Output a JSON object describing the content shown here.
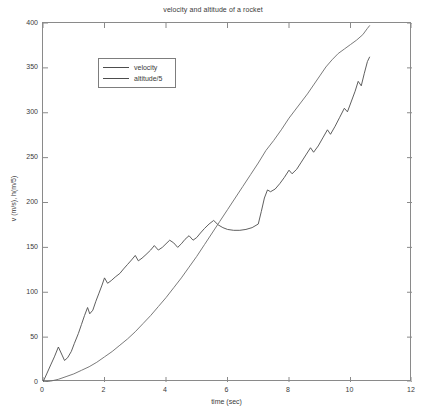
{
  "chart_data": {
    "type": "line",
    "title": "velocity and altitude of a rocket",
    "xlabel": "time (sec)",
    "ylabel": "v (m/s), h(m/5)",
    "xlim": [
      0,
      12
    ],
    "ylim": [
      0,
      400
    ],
    "xticks": [
      0,
      2,
      4,
      6,
      8,
      10,
      12
    ],
    "yticks": [
      0,
      50,
      100,
      150,
      200,
      250,
      300,
      350,
      400
    ],
    "grid": false,
    "legend_position": "upper left",
    "legend": [
      "velocity",
      "altitude/5"
    ],
    "series": [
      {
        "name": "velocity",
        "color": "#4d4d4d",
        "points": [
          [
            0.0,
            0
          ],
          [
            0.12,
            9
          ],
          [
            0.25,
            19
          ],
          [
            0.37,
            28
          ],
          [
            0.5,
            39
          ],
          [
            0.62,
            30
          ],
          [
            0.7,
            24
          ],
          [
            0.8,
            27
          ],
          [
            0.92,
            34
          ],
          [
            1.02,
            43
          ],
          [
            1.15,
            54
          ],
          [
            1.25,
            64
          ],
          [
            1.35,
            74
          ],
          [
            1.45,
            83
          ],
          [
            1.52,
            76
          ],
          [
            1.62,
            80
          ],
          [
            1.72,
            90
          ],
          [
            1.82,
            99
          ],
          [
            1.92,
            108
          ],
          [
            2.0,
            116
          ],
          [
            2.1,
            110
          ],
          [
            2.22,
            113
          ],
          [
            2.35,
            117
          ],
          [
            2.5,
            121
          ],
          [
            2.62,
            126
          ],
          [
            2.75,
            131
          ],
          [
            2.88,
            136
          ],
          [
            3.0,
            141
          ],
          [
            3.1,
            135
          ],
          [
            3.22,
            138
          ],
          [
            3.35,
            142
          ],
          [
            3.5,
            147
          ],
          [
            3.62,
            152
          ],
          [
            3.75,
            147
          ],
          [
            3.88,
            150
          ],
          [
            4.0,
            154
          ],
          [
            4.12,
            158
          ],
          [
            4.25,
            155
          ],
          [
            4.38,
            150
          ],
          [
            4.5,
            154
          ],
          [
            4.62,
            159
          ],
          [
            4.75,
            163
          ],
          [
            4.88,
            158
          ],
          [
            5.0,
            161
          ],
          [
            5.12,
            166
          ],
          [
            5.25,
            171
          ],
          [
            5.4,
            176
          ],
          [
            5.55,
            180
          ],
          [
            5.7,
            175
          ],
          [
            5.85,
            172
          ],
          [
            6.0,
            170
          ],
          [
            6.2,
            169
          ],
          [
            6.4,
            169
          ],
          [
            6.6,
            170
          ],
          [
            6.8,
            172
          ],
          [
            7.0,
            176
          ],
          [
            7.1,
            190
          ],
          [
            7.2,
            205
          ],
          [
            7.3,
            214
          ],
          [
            7.4,
            212
          ],
          [
            7.55,
            215
          ],
          [
            7.7,
            221
          ],
          [
            7.85,
            228
          ],
          [
            8.0,
            236
          ],
          [
            8.1,
            232
          ],
          [
            8.25,
            237
          ],
          [
            8.4,
            245
          ],
          [
            8.55,
            253
          ],
          [
            8.7,
            261
          ],
          [
            8.8,
            256
          ],
          [
            8.95,
            263
          ],
          [
            9.1,
            272
          ],
          [
            9.25,
            281
          ],
          [
            9.35,
            276
          ],
          [
            9.5,
            285
          ],
          [
            9.65,
            295
          ],
          [
            9.8,
            305
          ],
          [
            9.9,
            301
          ],
          [
            10.02,
            312
          ],
          [
            10.15,
            324
          ],
          [
            10.25,
            335
          ],
          [
            10.35,
            330
          ],
          [
            10.45,
            344
          ],
          [
            10.55,
            357
          ],
          [
            10.62,
            362
          ]
        ]
      },
      {
        "name": "altitude/5",
        "color": "#6b6b6b",
        "points": [
          [
            0.0,
            0
          ],
          [
            0.25,
            1
          ],
          [
            0.5,
            3
          ],
          [
            0.75,
            6
          ],
          [
            1.0,
            9
          ],
          [
            1.25,
            13
          ],
          [
            1.5,
            17
          ],
          [
            1.75,
            22
          ],
          [
            2.0,
            28
          ],
          [
            2.25,
            34
          ],
          [
            2.5,
            41
          ],
          [
            2.75,
            48
          ],
          [
            3.0,
            56
          ],
          [
            3.25,
            65
          ],
          [
            3.5,
            74
          ],
          [
            3.75,
            84
          ],
          [
            4.0,
            94
          ],
          [
            4.25,
            105
          ],
          [
            4.5,
            116
          ],
          [
            4.75,
            128
          ],
          [
            5.0,
            140
          ],
          [
            5.25,
            153
          ],
          [
            5.5,
            166
          ],
          [
            5.75,
            179
          ],
          [
            6.0,
            192
          ],
          [
            6.25,
            205
          ],
          [
            6.5,
            218
          ],
          [
            6.75,
            231
          ],
          [
            7.0,
            244
          ],
          [
            7.25,
            258
          ],
          [
            7.5,
            269
          ],
          [
            7.75,
            281
          ],
          [
            8.0,
            294
          ],
          [
            8.2,
            303
          ],
          [
            8.4,
            312
          ],
          [
            8.6,
            321
          ],
          [
            8.8,
            331
          ],
          [
            9.0,
            341
          ],
          [
            9.2,
            351
          ],
          [
            9.4,
            359
          ],
          [
            9.6,
            366
          ],
          [
            9.8,
            371
          ],
          [
            10.0,
            376
          ],
          [
            10.2,
            381
          ],
          [
            10.4,
            387
          ],
          [
            10.55,
            394
          ],
          [
            10.62,
            397
          ]
        ]
      }
    ]
  },
  "legend": {
    "items": [
      {
        "label": "velocity"
      },
      {
        "label": "altitude/5"
      }
    ]
  }
}
